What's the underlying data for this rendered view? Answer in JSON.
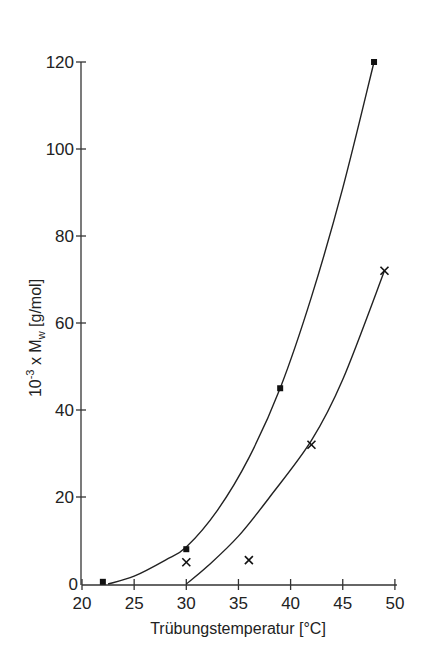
{
  "chart_data": {
    "type": "scatter",
    "title": "",
    "xlabel": "Trübungstemperatur [°C]",
    "ylabel": "10⁻³ x Mw [g/mol]",
    "ylabel_parts": {
      "prefix": "10",
      "exp": "-3",
      "mid": " x M",
      "sub": "w",
      "unit": " [g/mol]"
    },
    "xlim": [
      20,
      50
    ],
    "ylim": [
      0,
      120
    ],
    "xticks": [
      20,
      25,
      30,
      35,
      40,
      45,
      50
    ],
    "yticks": [
      0,
      20,
      40,
      60,
      80,
      100,
      120
    ],
    "grid": false,
    "legend": null,
    "series": [
      {
        "name": "Series 1 (filled squares)",
        "marker": "square",
        "points": [
          {
            "x": 22,
            "y": 0.5
          },
          {
            "x": 30,
            "y": 8
          },
          {
            "x": 39,
            "y": 45
          },
          {
            "x": 48,
            "y": 120
          }
        ],
        "fit_curve": [
          [
            22.5,
            0
          ],
          [
            25,
            1.8
          ],
          [
            28,
            5.5
          ],
          [
            30,
            8.5
          ],
          [
            33,
            17
          ],
          [
            36,
            29
          ],
          [
            39,
            45
          ],
          [
            42,
            66
          ],
          [
            45,
            91
          ],
          [
            48,
            120
          ]
        ]
      },
      {
        "name": "Series 2 (crosses)",
        "marker": "x",
        "points": [
          {
            "x": 30,
            "y": 5
          },
          {
            "x": 36,
            "y": 5.5
          },
          {
            "x": 42,
            "y": 32
          },
          {
            "x": 49,
            "y": 72
          }
        ],
        "fit_curve": [
          [
            30,
            0
          ],
          [
            32,
            4
          ],
          [
            35,
            11
          ],
          [
            38,
            20
          ],
          [
            42,
            33
          ],
          [
            45,
            47
          ],
          [
            49,
            72
          ]
        ]
      }
    ]
  }
}
